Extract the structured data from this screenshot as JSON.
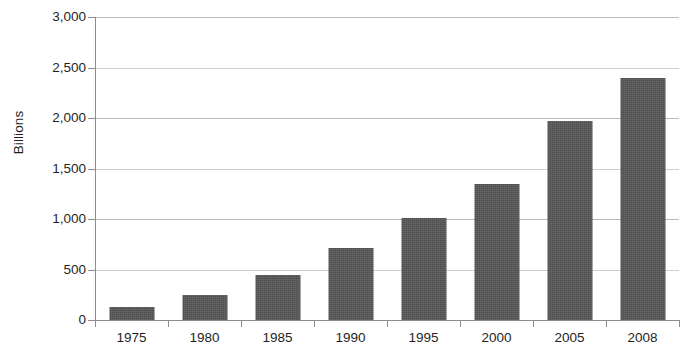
{
  "chart_data": {
    "type": "bar",
    "title": "",
    "subtitle": "",
    "xlabel": "",
    "ylabel": "Billions",
    "categories": [
      "1975",
      "1980",
      "1985",
      "1990",
      "1995",
      "2000",
      "2005",
      "2008"
    ],
    "values": [
      130,
      245,
      450,
      715,
      1010,
      1350,
      1975,
      2400
    ],
    "series": [
      {
        "name": "",
        "values": [
          130,
          245,
          450,
          715,
          1010,
          1350,
          1975,
          2400
        ]
      }
    ],
    "ylim": [
      0,
      3000
    ],
    "y_ticks": [
      0,
      500,
      1000,
      1500,
      2000,
      2500,
      3000
    ],
    "y_tick_labels": [
      "0",
      "500",
      "1,000",
      "1,500",
      "2,000",
      "2,500",
      "3,000"
    ],
    "grid": true,
    "grid_axis": "y",
    "legend": false,
    "legend_position": "none",
    "bar_color": "#585858",
    "gridline_color": "#b9b9b9",
    "axis_color": "#8c8c8c",
    "text_color": "#1f1f1f",
    "background": "#ffffff"
  }
}
